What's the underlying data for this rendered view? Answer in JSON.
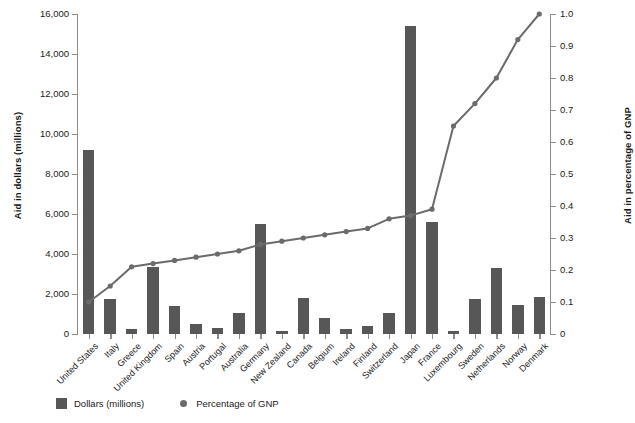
{
  "chart_data": {
    "type": "bar",
    "title": "",
    "subtitle": "",
    "xlabel": "",
    "ylabel": "Aid in dollars (millions)",
    "y2label": "Aid in percentage of GNP",
    "grid": false,
    "legend_position": "bottom-left",
    "ylim": [
      0,
      16000
    ],
    "y2lim": [
      0,
      1.0
    ],
    "ytick_labels": [
      "16,000",
      "14,000",
      "12,000",
      "10,000",
      "8,000",
      "6,000",
      "4,000",
      "2,000",
      "0"
    ],
    "ytick_values": [
      16000,
      14000,
      12000,
      10000,
      8000,
      6000,
      4000,
      2000,
      0
    ],
    "y2tick_labels": [
      "1.0",
      "0.9",
      "0.8",
      "0.7",
      "0.6",
      "0.5",
      "0.4",
      "0.3",
      "0.2",
      "0.1",
      "0"
    ],
    "y2tick_values": [
      1.0,
      0.9,
      0.8,
      0.7,
      0.6,
      0.5,
      0.4,
      0.3,
      0.2,
      0.1,
      0
    ],
    "categories": [
      "United States",
      "Italy",
      "Greece",
      "United Kingdom",
      "Spain",
      "Austria",
      "Portugal",
      "Australia",
      "Germany",
      "New Zealand",
      "Canada",
      "Belgium",
      "Ireland",
      "Finland",
      "Switzerland",
      "Japan",
      "France",
      "Luxembourg",
      "Sweden",
      "Netherlands",
      "Norway",
      "Denmark"
    ],
    "series": [
      {
        "name": "Dollars (millions)",
        "axis": "left",
        "type": "bar",
        "color": "#575757",
        "values": [
          9200,
          1750,
          250,
          3350,
          1400,
          500,
          300,
          1050,
          5500,
          150,
          1800,
          800,
          250,
          400,
          1050,
          15400,
          5600,
          150,
          1750,
          3300,
          1450,
          1850
        ]
      },
      {
        "name": "Percentage of GNP",
        "axis": "right",
        "type": "line",
        "color": "#6b6b6b",
        "values": [
          0.1,
          0.15,
          0.21,
          0.22,
          0.23,
          0.24,
          0.25,
          0.26,
          0.28,
          0.29,
          0.3,
          0.31,
          0.32,
          0.33,
          0.36,
          0.37,
          0.39,
          0.65,
          0.72,
          0.8,
          0.92,
          1.0
        ]
      }
    ]
  },
  "legend": {
    "items": [
      {
        "label": "Dollars (millions)",
        "marker": "square-swatch-icon",
        "color": "#575757"
      },
      {
        "label": "Percentage of GNP",
        "marker": "circle-dot-icon",
        "color": "#6b6b6b"
      }
    ]
  },
  "colors": {
    "bar": "#575757",
    "line": "#6b6b6b",
    "axis": "#8c8c8c",
    "text": "#1a1a1a",
    "background": "#ffffff"
  }
}
